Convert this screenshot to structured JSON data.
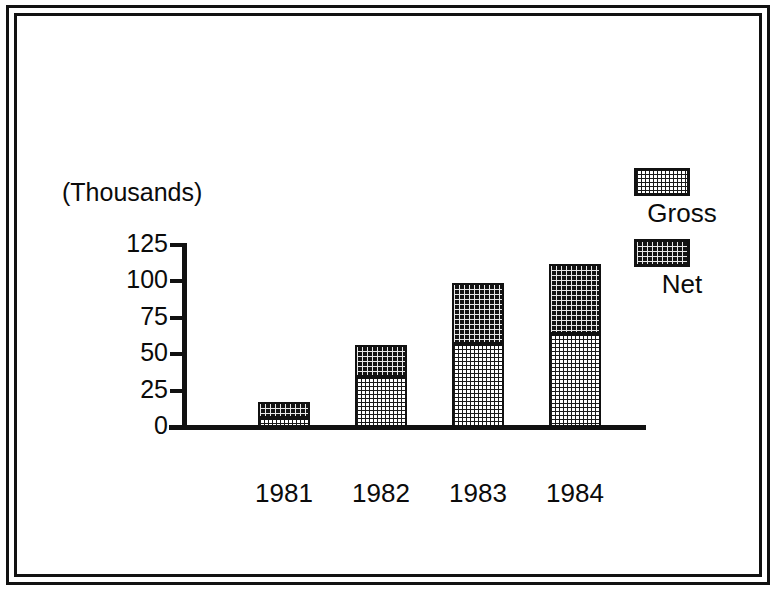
{
  "chart_data": {
    "type": "bar",
    "subtype": "stacked-vertical",
    "title": "",
    "subtitle": "",
    "units_label": "(Thousands)",
    "xlabel": "",
    "ylabel": "",
    "categories": [
      "1981",
      "1982",
      "1983",
      "1984"
    ],
    "series": [
      {
        "name": "Gross",
        "values": [
          6,
          34,
          57,
          64
        ],
        "fill": "light-checker",
        "color": "#ffffff"
      },
      {
        "name": "Net",
        "values": [
          11,
          22,
          42,
          48
        ],
        "fill": "dark-dotted",
        "color": "#141414"
      }
    ],
    "stack_totals": [
      17,
      56,
      99,
      112
    ],
    "ylim": [
      0,
      125
    ],
    "yticks": [
      125,
      100,
      75,
      50,
      25,
      0
    ],
    "ytick_labels": [
      "125",
      "100",
      "75",
      "50",
      "25",
      "0"
    ],
    "grid": false,
    "legend_position": "right-top",
    "legend_entries": [
      "Gross",
      "Net"
    ]
  },
  "axis": {
    "units_caption": "(Thousands)",
    "y_ticks": [
      {
        "label": "125",
        "value": 125
      },
      {
        "label": "100",
        "value": 100
      },
      {
        "label": "75",
        "value": 75
      },
      {
        "label": "50",
        "value": 50
      },
      {
        "label": "25",
        "value": 25
      },
      {
        "label": "0",
        "value": 0
      }
    ],
    "x_ticks": [
      {
        "label": "1981"
      },
      {
        "label": "1982"
      },
      {
        "label": "1983"
      },
      {
        "label": "1984"
      }
    ]
  },
  "legend": {
    "items": [
      {
        "label": "Gross",
        "swatch": "light-checker-swatch"
      },
      {
        "label": "Net",
        "swatch": "dark-dotted-swatch"
      }
    ]
  },
  "colors": {
    "ink": "#111111",
    "paper": "#ffffff",
    "net_fill": "#141414",
    "gross_fill": "#ffffff"
  }
}
